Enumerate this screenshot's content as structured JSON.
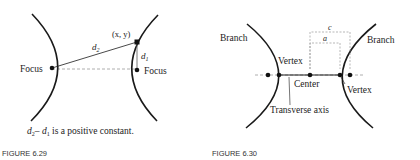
{
  "figures": [
    {
      "id": "fig629",
      "caption_label": "FIGURE 6.29",
      "statement": "d₂– d₁ is a positive constant.",
      "statement_parts": {
        "d2": "d",
        "sub2": "2",
        "minus": "– ",
        "d1": "d",
        "sub1": "1",
        "rest": " is a positive constant."
      },
      "labels": {
        "left_focus": "Focus",
        "right_focus": "Focus",
        "point": "(x, y)",
        "d2": "d",
        "d2_sub": "2",
        "d1": "d",
        "d1_sub": "1"
      }
    },
    {
      "id": "fig630",
      "caption_label": "FIGURE 6.30",
      "labels": {
        "left_branch": "Branch",
        "right_branch": "Branch",
        "left_vertex": "Vertex",
        "right_vertex": "Vertex",
        "center": "Center",
        "transverse_axis": "Transverse axis",
        "c": "c",
        "a": "a"
      }
    }
  ],
  "colors": {
    "curve": "#1a1a1a",
    "dashed": "#999999",
    "caption": "#333333"
  }
}
